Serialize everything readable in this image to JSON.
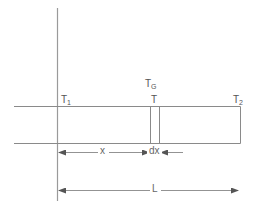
{
  "diagram": {
    "colors": {
      "line": "#8a8a8a",
      "wall": "#9a9a9a",
      "arrow": "#555555",
      "text": "#555555",
      "background": "#ffffff"
    },
    "labels": {
      "t1": {
        "base": "T",
        "sub": "1"
      },
      "t2": {
        "base": "T",
        "sub": "2"
      },
      "t": {
        "base": "T"
      },
      "tg": {
        "base": "T",
        "sub": "G"
      }
    },
    "dimensions": {
      "x": {
        "label": "x"
      },
      "dx": {
        "label": "dx"
      },
      "L": {
        "label": "L"
      }
    }
  }
}
